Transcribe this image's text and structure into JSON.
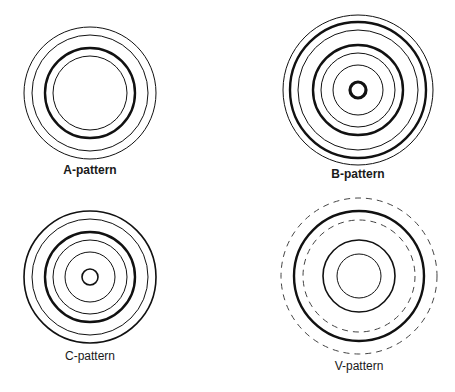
{
  "figure": {
    "background": "#ffffff",
    "stroke_color": "#111111",
    "patterns": [
      {
        "id": "A",
        "label": "A-pattern",
        "center": [
          90,
          93
        ],
        "label_pos": [
          90,
          174
        ],
        "rings": [
          {
            "r": 66,
            "weight": "thin",
            "style": "solid"
          },
          {
            "r": 58,
            "weight": "thin",
            "style": "solid"
          },
          {
            "r": 45,
            "weight": "thick",
            "style": "solid"
          },
          {
            "r": 37,
            "weight": "thin",
            "style": "solid"
          }
        ]
      },
      {
        "id": "B",
        "label": "B-pattern",
        "center": [
          358,
          90
        ],
        "label_pos": [
          358,
          178
        ],
        "rings": [
          {
            "r": 75,
            "weight": "thin",
            "style": "solid"
          },
          {
            "r": 68,
            "weight": "thick",
            "style": "solid"
          },
          {
            "r": 60,
            "weight": "thin",
            "style": "solid"
          },
          {
            "r": 45,
            "weight": "thick",
            "style": "solid"
          },
          {
            "r": 37,
            "weight": "thin",
            "style": "solid"
          },
          {
            "r": 25,
            "weight": "thin",
            "style": "solid"
          },
          {
            "r": 8,
            "weight": "heavy",
            "style": "solid"
          }
        ]
      },
      {
        "id": "C",
        "label": "C-pattern",
        "center": [
          90,
          277
        ],
        "label_pos": [
          90,
          360
        ],
        "rings": [
          {
            "r": 66,
            "weight": "medium",
            "style": "solid"
          },
          {
            "r": 58,
            "weight": "thin",
            "style": "solid"
          },
          {
            "r": 45,
            "weight": "thick",
            "style": "solid"
          },
          {
            "r": 37,
            "weight": "thin",
            "style": "solid"
          },
          {
            "r": 25,
            "weight": "thin",
            "style": "solid"
          },
          {
            "r": 8,
            "weight": "medium",
            "style": "solid"
          }
        ]
      },
      {
        "id": "V",
        "label": "V-pattern",
        "center": [
          359,
          276
        ],
        "label_pos": [
          359,
          370
        ],
        "rings": [
          {
            "r": 78,
            "weight": "thin",
            "style": "dashed"
          },
          {
            "r": 65,
            "weight": "thick",
            "style": "solid"
          },
          {
            "r": 56,
            "weight": "thin",
            "style": "dashed"
          },
          {
            "r": 36,
            "weight": "medium",
            "style": "solid"
          },
          {
            "r": 22,
            "weight": "thin",
            "style": "solid"
          }
        ]
      }
    ]
  }
}
